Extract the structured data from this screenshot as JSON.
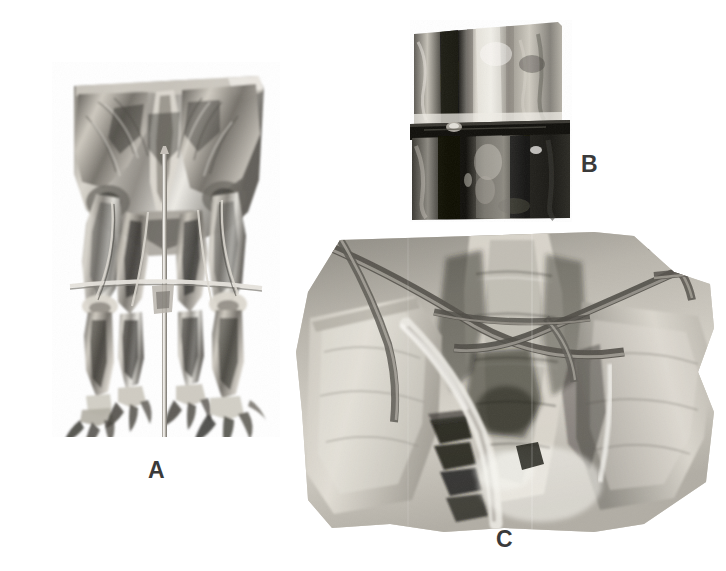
{
  "figure": {
    "type": "multi-panel photographic plate",
    "background_color": "#ffffff",
    "ink_color": "#3a3a3a",
    "panel_count": 3
  },
  "panels": [
    {
      "id": "A",
      "label": "A",
      "name": "panel-a",
      "caption_position": "below-center",
      "description": "Front view of a mounted skeleton's hind limbs and pelvic girdle with a vertical metal support rod and a horizontal cross bar",
      "bbox": {
        "x": 52,
        "y": 62,
        "w": 228,
        "h": 375
      },
      "label_pos": {
        "x": 148,
        "y": 459
      },
      "tone": "grayscale photograph"
    },
    {
      "id": "B",
      "label": "B",
      "name": "panel-b",
      "caption_position": "right",
      "description": "Close-up of a vertical bone shaft with a dark horizontal metal clamp band across the middle",
      "bbox": {
        "x": 410,
        "y": 20,
        "w": 162,
        "h": 202
      },
      "label_pos": {
        "x": 581,
        "y": 153
      },
      "tone": "grayscale photograph"
    },
    {
      "id": "C",
      "label": "C",
      "name": "panel-c",
      "caption_position": "below-center",
      "description": "Close-up of the pelvic and sacral region showing vertebrae, ilia and crossing support rods",
      "bbox": {
        "x": 294,
        "y": 232,
        "w": 420,
        "h": 300
      },
      "label_pos": {
        "x": 496,
        "y": 528
      },
      "tone": "grayscale photograph"
    }
  ],
  "colors": {
    "background": "#ffffff",
    "label_ink": "#3a3a3a",
    "bone_light": "#e8e6e0",
    "bone_mid": "#b9b5ab",
    "bone_shadow": "#6d6a63",
    "deep_shadow": "#2b2a27",
    "metal_rod": "#cfcbc2",
    "metal_dark": "#17160f"
  }
}
